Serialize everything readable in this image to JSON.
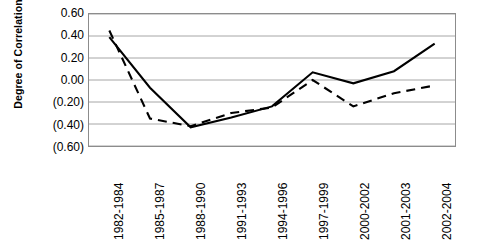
{
  "chart_data": {
    "type": "line",
    "title": "",
    "subtitle": "",
    "xlabel": "",
    "ylabel": "Degree of Correlation",
    "categories": [
      "1982-1984",
      "1985-1987",
      "1988-1990",
      "1991-1993",
      "1994-1996",
      "1997-1999",
      "2000-2002",
      "2001-2003",
      "2002-2004"
    ],
    "ylim": [
      -0.6,
      0.6
    ],
    "ytick_values": [
      0.6,
      0.4,
      0.2,
      0.0,
      -0.2,
      -0.4,
      -0.6
    ],
    "ytick_labels": [
      "0.60",
      "0.40",
      "0.20",
      "0.00",
      "(0.20)",
      "(0.40)",
      "(0.60)"
    ],
    "grid": true,
    "legend": false,
    "legend_position": "none",
    "series": [
      {
        "name": "Series 1",
        "style": "solid",
        "color": "#000000",
        "values": [
          0.39,
          -0.07,
          -0.43,
          -0.34,
          -0.24,
          0.07,
          -0.03,
          0.08,
          0.33
        ]
      },
      {
        "name": "Series 2",
        "style": "dashed",
        "color": "#000000",
        "values": [
          0.45,
          -0.35,
          -0.42,
          -0.3,
          -0.25,
          0.0,
          -0.24,
          -0.12,
          -0.05
        ]
      }
    ]
  },
  "axes": {
    "y_title": "Degree of Correlation"
  }
}
